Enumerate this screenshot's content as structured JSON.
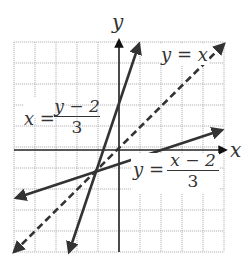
{
  "chart_data": {
    "type": "line",
    "title": "",
    "xlabel": "x",
    "ylabel": "y",
    "xlim": [
      -5,
      5
    ],
    "ylim": [
      -5,
      5
    ],
    "grid": true,
    "grid_spacing": 1,
    "series": [
      {
        "name": "y = x",
        "style": "dashed",
        "points": [
          [
            -5,
            -5
          ],
          [
            5,
            5
          ]
        ]
      },
      {
        "name": "y = (x - 2)/3",
        "style": "solid",
        "points": [
          [
            -5,
            -2.333
          ],
          [
            5,
            1
          ]
        ]
      },
      {
        "name": "x = (y - 2)/3",
        "style": "solid",
        "points": [
          [
            -2.333,
            -5
          ],
          [
            0.667,
            4
          ]
        ]
      }
    ],
    "intersection": [
      -1,
      -1
    ],
    "annotations": [
      {
        "text": "y = x",
        "near": [
          3,
          4.3
        ]
      },
      {
        "text": "x = (y - 2)/3",
        "near": [
          -4,
          1
        ]
      },
      {
        "text": "y = (x - 2)/3",
        "near": [
          2.5,
          -1
        ]
      }
    ]
  },
  "labels": {
    "x_axis": "x",
    "y_axis": "y",
    "identity_line": "y = x",
    "line1_lhs": "x =",
    "line1_num": "y − 2",
    "line1_den": "3",
    "line2_lhs": "y =",
    "line2_num": "x − 2",
    "line2_den": "3"
  },
  "colors": {
    "grid": "#b5b5b5",
    "axis": "#222222",
    "lines": "#333333"
  }
}
